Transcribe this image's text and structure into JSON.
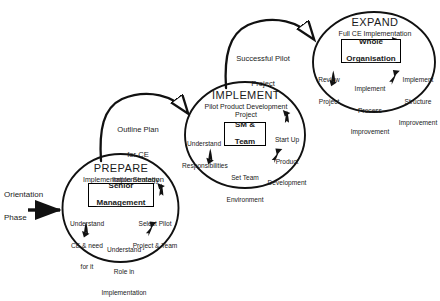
{
  "diagram": {
    "type": "process-cycle-diagram",
    "stroke_color": "#000000",
    "background_color": "#ffffff",
    "entry": {
      "line1": "Orientation",
      "line2": "Phase",
      "arrow_name": "entry-arrow"
    },
    "connectors": [
      {
        "id": "prepare-to-implement",
        "label_lines": [
          "Outline Plan",
          "for CE",
          "Implementation"
        ],
        "from": "PREPARE",
        "to": "IMPLEMENT"
      },
      {
        "id": "implement-to-expand",
        "label_lines": [
          "Successful Pilot",
          "Project"
        ],
        "from": "IMPLEMENT",
        "to": "EXPAND"
      }
    ],
    "phases": [
      {
        "id": "prepare",
        "title": "PREPARE",
        "subtitle": "Implementation Strategy",
        "core_lines": [
          "Senior",
          "Management"
        ],
        "core_underline_line": 1,
        "spokes": [
          {
            "id": "prepare-left",
            "lines": [
              "Understand",
              "CE & need",
              "for it"
            ]
          },
          {
            "id": "prepare-right",
            "lines": [
              "Select Pilot",
              "Project & Team"
            ]
          },
          {
            "id": "prepare-bottom",
            "lines": [
              "Understand",
              "Role in",
              "Implementation"
            ]
          }
        ]
      },
      {
        "id": "implement",
        "title": "IMPLEMENT",
        "subtitle": "Pilot Product Development\nProject",
        "core_lines": [
          "SM &",
          "Team"
        ],
        "core_underline_line": -1,
        "spokes": [
          {
            "id": "implement-left",
            "lines": [
              "Understand",
              "Responsibilities"
            ]
          },
          {
            "id": "implement-right",
            "lines": [
              "Start Up",
              "Product",
              "Development"
            ]
          },
          {
            "id": "implement-bottom",
            "lines": [
              "Set Team",
              "Environment"
            ]
          }
        ]
      },
      {
        "id": "expand",
        "title": "EXPAND",
        "subtitle": "Full CE Implementation",
        "core_lines": [
          "Whole",
          "Organisation"
        ],
        "core_underline_line": 1,
        "spokes": [
          {
            "id": "expand-left",
            "lines": [
              "Review",
              "Project"
            ]
          },
          {
            "id": "expand-right",
            "lines": [
              "Implement",
              "Structure",
              "Improvement"
            ]
          },
          {
            "id": "expand-bottom",
            "lines": [
              "Implement",
              "Process",
              "Improvement"
            ]
          }
        ]
      }
    ]
  }
}
